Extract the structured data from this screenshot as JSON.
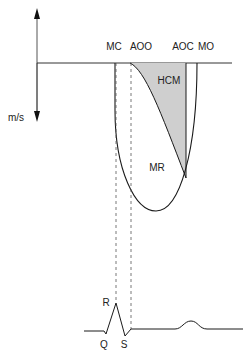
{
  "diagram": {
    "title": "",
    "axis": {
      "unit_label": "m/s"
    },
    "timing_labels": {
      "mc": "MC",
      "aoo": "AOO",
      "aoc": "AOC",
      "mo": "MO"
    },
    "region_labels": {
      "hcm": "HCM",
      "mr": "MR"
    },
    "ecg_labels": {
      "r": "R",
      "q": "Q",
      "s": "S"
    },
    "colors": {
      "line": "#1a1a1a",
      "hcm_fill": "#cfcfcf",
      "dashed": "#555555"
    }
  }
}
